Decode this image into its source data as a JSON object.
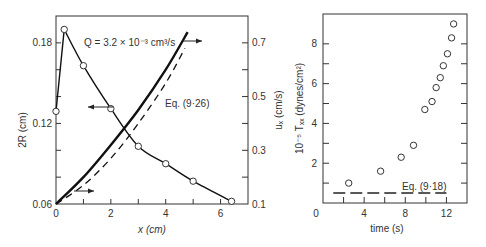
{
  "chart_data": [
    {
      "type": "line",
      "title": "",
      "annotation": "Q = 3.2 × 10⁻³ cm³/s",
      "xlabel": "x (cm)",
      "ylabel_left": "2R (cm)",
      "ylabel_right": "uₓ (cm/s)",
      "xlim": [
        0,
        7
      ],
      "ylim_left": [
        0.06,
        0.2
      ],
      "ylim_right": [
        0.1,
        0.8
      ],
      "x_ticks": [
        "0",
        "2",
        "4",
        "6"
      ],
      "y_ticks_left": [
        "0.06",
        "0.12",
        "0.18"
      ],
      "y_ticks_right": [
        "0.1",
        "0.3",
        "0.5",
        "0.7"
      ],
      "series": [
        {
          "name": "2R (measured)",
          "axis": "left",
          "style": "solid with open circles",
          "x": [
            0,
            0.3,
            1,
            2,
            3,
            4,
            5,
            6.4
          ],
          "y": [
            0.129,
            0.19,
            0.163,
            0.131,
            0.103,
            0.09,
            0.077,
            0.062
          ]
        },
        {
          "name": "uₓ",
          "axis": "right",
          "style": "thick solid",
          "x": [
            0,
            1,
            2,
            3,
            4,
            4.8
          ],
          "y": [
            0.1,
            0.2,
            0.32,
            0.45,
            0.6,
            0.74
          ]
        },
        {
          "name": "Eq. (9·26)",
          "axis": "right",
          "style": "dashed",
          "x": [
            0,
            1,
            2,
            3,
            4,
            4.7
          ],
          "y": [
            0.1,
            0.17,
            0.27,
            0.4,
            0.55,
            0.68
          ]
        }
      ],
      "labels": {
        "eq": "Eq. (9·26)"
      }
    },
    {
      "type": "scatter",
      "title": "",
      "xlabel": "time (s)",
      "ylabel": "10⁻⁵ Tₓₓ (dynes/cm²)",
      "xlim": [
        0,
        14
      ],
      "ylim": [
        0,
        9.5
      ],
      "x_ticks": [
        "0",
        "4",
        "8",
        "12"
      ],
      "y_ticks": [
        "2",
        "4",
        "6",
        "8"
      ],
      "series": [
        {
          "name": "measured",
          "style": "open circles",
          "x": [
            2.5,
            5.6,
            7.6,
            8.8,
            9.9,
            10.6,
            11.0,
            11.4,
            11.7,
            12.1,
            12.5,
            12.7
          ],
          "y": [
            1.0,
            1.6,
            2.3,
            2.9,
            4.7,
            5.1,
            5.8,
            6.3,
            6.9,
            7.5,
            8.3,
            9.0
          ]
        },
        {
          "name": "Eq. (9·18)",
          "style": "dashed horizontal",
          "x": [
            1,
            12
          ],
          "y": [
            0.5,
            0.5
          ]
        }
      ],
      "labels": {
        "eq": "Eq. (9·18)"
      }
    }
  ]
}
